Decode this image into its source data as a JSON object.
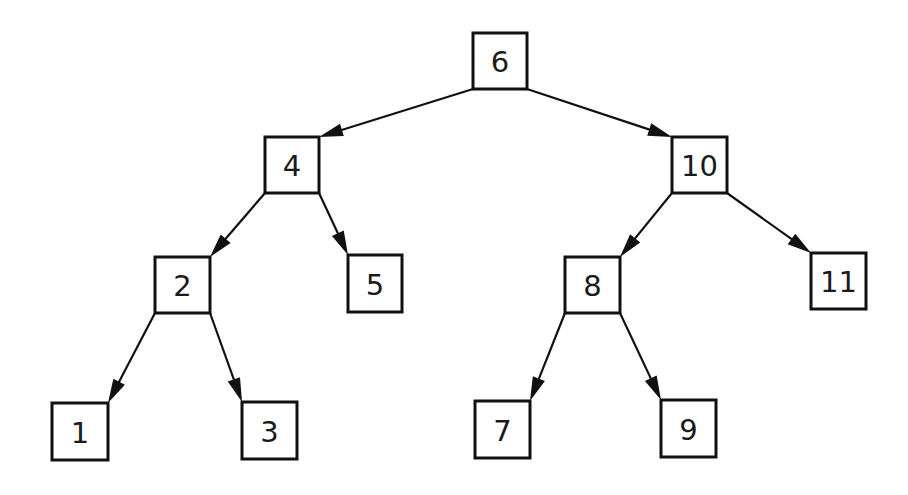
{
  "diagram": {
    "type": "binary-search-tree",
    "colors": {
      "stroke": "#111111",
      "text": "#1a1a1a",
      "background": "#ffffff"
    },
    "nodes": [
      {
        "id": "n6",
        "label": "6",
        "x": 473,
        "y": 33,
        "w": 54,
        "h": 56
      },
      {
        "id": "n4",
        "label": "4",
        "x": 265,
        "y": 137,
        "w": 54,
        "h": 56
      },
      {
        "id": "n10",
        "label": "10",
        "x": 672,
        "y": 137,
        "w": 55,
        "h": 56
      },
      {
        "id": "n2",
        "label": "2",
        "x": 155,
        "y": 257,
        "w": 55,
        "h": 56
      },
      {
        "id": "n5",
        "label": "5",
        "x": 348,
        "y": 255,
        "w": 54,
        "h": 57
      },
      {
        "id": "n8",
        "label": "8",
        "x": 565,
        "y": 257,
        "w": 55,
        "h": 56
      },
      {
        "id": "n11",
        "label": "11",
        "x": 811,
        "y": 253,
        "w": 55,
        "h": 56
      },
      {
        "id": "n1",
        "label": "1",
        "x": 52,
        "y": 403,
        "w": 56,
        "h": 57
      },
      {
        "id": "n3",
        "label": "3",
        "x": 242,
        "y": 402,
        "w": 55,
        "h": 57
      },
      {
        "id": "n7",
        "label": "7",
        "x": 475,
        "y": 401,
        "w": 55,
        "h": 57
      },
      {
        "id": "n9",
        "label": "9",
        "x": 661,
        "y": 400,
        "w": 55,
        "h": 57
      }
    ],
    "edges": [
      {
        "from": "6",
        "to": "4",
        "x1": 473,
        "y1": 89,
        "x2": 319,
        "y2": 137
      },
      {
        "from": "6",
        "to": "10",
        "x1": 527,
        "y1": 89,
        "x2": 672,
        "y2": 137
      },
      {
        "from": "4",
        "to": "2",
        "x1": 265,
        "y1": 193,
        "x2": 210,
        "y2": 257
      },
      {
        "from": "4",
        "to": "5",
        "x1": 319,
        "y1": 193,
        "x2": 348,
        "y2": 255
      },
      {
        "from": "10",
        "to": "8",
        "x1": 672,
        "y1": 193,
        "x2": 620,
        "y2": 257
      },
      {
        "from": "10",
        "to": "11",
        "x1": 727,
        "y1": 193,
        "x2": 811,
        "y2": 253
      },
      {
        "from": "2",
        "to": "1",
        "x1": 155,
        "y1": 313,
        "x2": 108,
        "y2": 403
      },
      {
        "from": "2",
        "to": "3",
        "x1": 210,
        "y1": 313,
        "x2": 242,
        "y2": 402
      },
      {
        "from": "8",
        "to": "7",
        "x1": 565,
        "y1": 313,
        "x2": 530,
        "y2": 401
      },
      {
        "from": "8",
        "to": "9",
        "x1": 620,
        "y1": 313,
        "x2": 661,
        "y2": 400
      }
    ]
  }
}
